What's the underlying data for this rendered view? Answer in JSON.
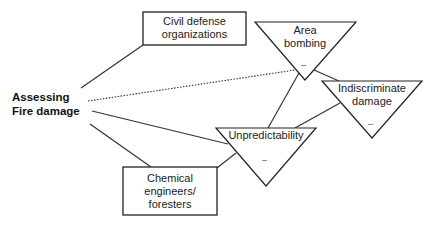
{
  "diagram": {
    "central_node": {
      "line1": "Assessing",
      "line2": "Fire damage"
    },
    "boxes": {
      "civil_defense": {
        "line1": "Civil defense",
        "line2": "organizations"
      },
      "chemical": {
        "line1": "Chemical",
        "line2": "engineers/",
        "line3": "foresters"
      }
    },
    "triangles": {
      "area_bombing": {
        "line1": "Area",
        "line2": "bombing",
        "sign": "–"
      },
      "indiscriminate": {
        "line1": "Indiscriminate",
        "line2": "damage",
        "sign": "–"
      },
      "unpredictability": {
        "line1": "Unpredictability",
        "sign": "–"
      }
    },
    "colors": {
      "line": "#333333",
      "background": "#ffffff"
    }
  }
}
